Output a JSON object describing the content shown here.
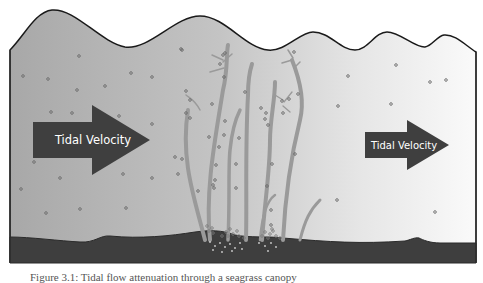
{
  "diagram": {
    "arrows": [
      {
        "label": "Tidal Velocity",
        "size": "large",
        "position": "left"
      },
      {
        "label": "Tidal Velocity",
        "size": "small",
        "position": "right"
      }
    ],
    "colors": {
      "water_left": "#a9a9a9",
      "water_right": "#f4f4f4",
      "sediment": "#3e3e3e",
      "arrow": "#3f3f3f",
      "seagrass": "#9a9a9a",
      "outline": "#1a1a1a"
    },
    "caption": "Figure 3.1: Tidal flow attenuation through a seagrass canopy"
  }
}
